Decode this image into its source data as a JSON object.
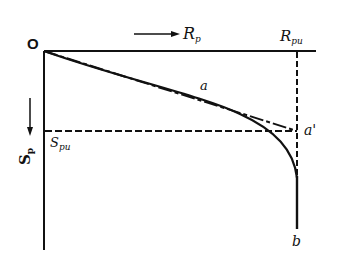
{
  "diagram": {
    "type": "load-settlement curve",
    "labels": {
      "origin": "O",
      "x_axis": "R",
      "x_axis_sub": "p",
      "x_ultimate": "R",
      "x_ultimate_sub": "pu",
      "y_axis": "S",
      "y_axis_sub": "p",
      "y_ultimate": "S",
      "y_ultimate_sub": "pu",
      "curve_point_a": "a",
      "point_a_prime": "a'",
      "point_b": "b"
    },
    "arrows": {
      "x_direction": "right",
      "y_direction": "down"
    },
    "colors": {
      "line": "#111111",
      "background": "#ffffff"
    }
  }
}
